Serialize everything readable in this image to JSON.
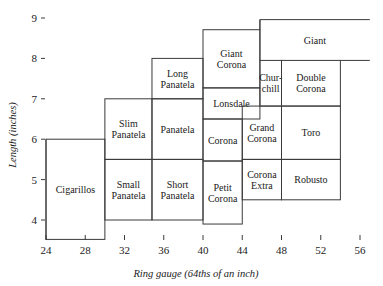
{
  "chart_data": {
    "type": "table",
    "title": "",
    "xlabel": "Ring gauge (64ths of an inch)",
    "ylabel": "Length (inches)",
    "xlim": [
      23,
      58
    ],
    "ylim": [
      3.4,
      9.2
    ],
    "xticks": [
      24,
      28,
      32,
      36,
      40,
      44,
      48,
      52,
      56
    ],
    "yticks": [
      4,
      5,
      6,
      7,
      8,
      9
    ],
    "grid": false,
    "legend": "none",
    "boxes": [
      {
        "name": "Cigarillos",
        "label": "Cigarillos",
        "x0": 24,
        "x1": 30,
        "y0": 3.52,
        "y1": 6.0,
        "open": false
      },
      {
        "name": "Slim Panatela",
        "label": "Slim\nPanatela",
        "x0": 30,
        "x1": 34.8,
        "y0": 5.5,
        "y1": 7.0,
        "open": false
      },
      {
        "name": "Small Panatela",
        "label": "Small\nPanatela",
        "x0": 30,
        "x1": 34.8,
        "y0": 4.0,
        "y1": 5.5,
        "open": false
      },
      {
        "name": "Panatela",
        "label": "Panatela",
        "x0": 34.8,
        "x1": 40,
        "y0": 5.5,
        "y1": 7.0,
        "open": false
      },
      {
        "name": "Short Panatela",
        "label": "Short\nPanatela",
        "x0": 34.8,
        "x1": 40,
        "y0": 4.0,
        "y1": 5.5,
        "open": false
      },
      {
        "name": "Long Panatela",
        "label": "Long\nPanatela",
        "x0": 34.8,
        "x1": 40,
        "y0": 7.0,
        "y1": 8.0,
        "open": false
      },
      {
        "name": "Giant Corona",
        "label": "Giant\nCorona",
        "x0": 40,
        "x1": 45.8,
        "y0": 7.27,
        "y1": 8.71,
        "open": false
      },
      {
        "name": "Lonsdale",
        "label": "Lonsdale",
        "x0": 40,
        "x1": 45.8,
        "y0": 6.5,
        "y1": 7.27,
        "open": false
      },
      {
        "name": "Corona",
        "label": "Corona",
        "x0": 40,
        "x1": 44,
        "y0": 5.46,
        "y1": 6.5,
        "open": false
      },
      {
        "name": "Petit Corona",
        "label": "Petit\nCorona",
        "x0": 40,
        "x1": 44,
        "y0": 3.9,
        "y1": 5.46,
        "open": false
      },
      {
        "name": "Grand Corona",
        "label": "Grand\nCorona",
        "x0": 44,
        "x1": 48,
        "y0": 5.5,
        "y1": 6.82,
        "open": false
      },
      {
        "name": "Corona Extra",
        "label": "Corona\nExtra",
        "x0": 44,
        "x1": 48,
        "y0": 4.5,
        "y1": 5.5,
        "open": false
      },
      {
        "name": "Churchill",
        "label": "Chur-\nchill",
        "x0": 45.8,
        "x1": 48,
        "y0": 6.82,
        "y1": 7.95,
        "open": false
      },
      {
        "name": "Double Corona",
        "label": "Double\nCorona",
        "x0": 48,
        "x1": 54,
        "y0": 6.82,
        "y1": 7.95,
        "open": false
      },
      {
        "name": "Toro",
        "label": "Toro",
        "x0": 48,
        "x1": 54,
        "y0": 5.5,
        "y1": 6.82,
        "open": false
      },
      {
        "name": "Robusto",
        "label": "Robusto",
        "x0": 48,
        "x1": 54,
        "y0": 4.5,
        "y1": 5.5,
        "open": false
      },
      {
        "name": "Giant",
        "label": "Giant",
        "x0": 45.8,
        "x1": 57,
        "y0": 7.95,
        "y1": 8.96,
        "open": true
      }
    ]
  }
}
